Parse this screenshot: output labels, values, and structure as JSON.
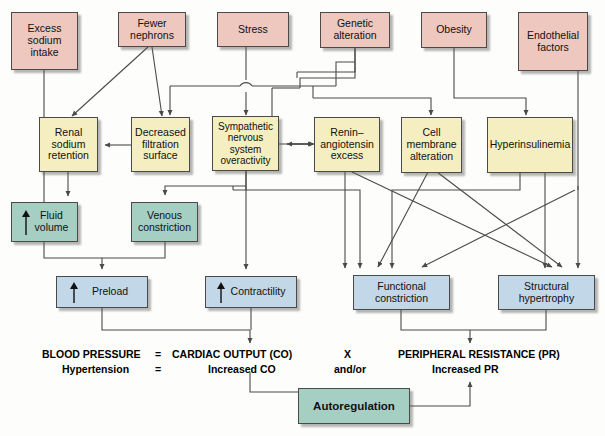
{
  "figure": {
    "background": "#fdfdfb",
    "colors": {
      "pink": "#eec7bf",
      "yellow": "#f4eec0",
      "teal": "#a6cfc4",
      "blue": "#c2d8e8",
      "line": "#4a4a4a",
      "text": "#111111"
    }
  },
  "nodes": {
    "excess_sodium_intake": "Excess\nsodium\nintake",
    "fewer_nephrons": "Fewer\nnephrons",
    "stress": "Stress",
    "genetic_alteration": "Genetic\nalteration",
    "obesity": "Obesity",
    "endothelial_factors": "Endothelial\nfactors",
    "renal_sodium_retention": "Renal\nsodium\nretention",
    "decreased_filtration_surface": "Decreased\nfiltration\nsurface",
    "sympathetic_nervous_system_overactivity": "Sympathetic\nnervous\nsystem\noveractivity",
    "renin_angiotensin_excess": "Renin–\nangiotensin\nexcess",
    "cell_membrane_alteration": "Cell\nmembrane\nalteration",
    "hyperinsulinemia": "Hyperinsulinemia",
    "fluid_volume": "Fluid\nvolume",
    "venous_constriction": "Venous\nconstriction",
    "preload": "Preload",
    "contractility": "Contractility",
    "functional_constriction": "Functional\nconstriction",
    "structural_hypertrophy": "Structural\nhypertrophy",
    "autoregulation": "Autoregulation"
  },
  "equation": {
    "blood_pressure_label": "BLOOD PRESSURE",
    "equals_1": "=",
    "cardiac_output_label": "CARDIAC OUTPUT (CO)",
    "times_label": "X",
    "peripheral_resistance_label": "PERIPHERAL RESISTANCE (PR)",
    "hypertension_label": "Hypertension",
    "equals_2": "=",
    "increased_co_label": "Increased CO",
    "and_or_label": "and/or",
    "increased_pr_label": "Increased PR"
  }
}
